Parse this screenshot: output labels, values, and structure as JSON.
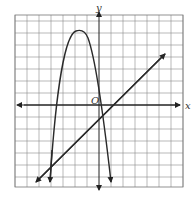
{
  "figure": {
    "type": "coordinate-plane-graph",
    "axes": {
      "x_label": "x",
      "y_label": "y",
      "origin_label": "O"
    },
    "grid": {
      "columns": 14,
      "rows": 14,
      "unit_px": 12
    },
    "curves": [
      {
        "name": "parabola",
        "description": "Downward-opening parabola, vertex near (-1.5, 6) in grid units, arrows pointing down on both ends",
        "vertex_grid": [
          -1.5,
          6
        ],
        "arrows": "down-both-ends"
      },
      {
        "name": "line",
        "description": "Line with positive slope (~0.8), crossing y-axis near -0.8, arrows both ends",
        "slope_approx": 0.8,
        "y_intercept_approx": -0.8,
        "arrows": "both-ends"
      }
    ]
  }
}
